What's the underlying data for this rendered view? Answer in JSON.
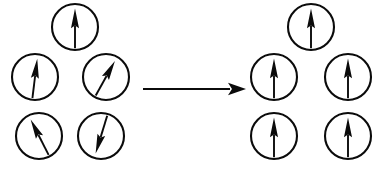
{
  "figure": {
    "width": 386,
    "height": 174,
    "background_color": "#ffffff",
    "ink_color": "#0b0b0b"
  },
  "reaction_arrow": {
    "name": "rightwards-arrow",
    "label": "",
    "x_start": 143,
    "x_end": 246,
    "y": 89,
    "direction": "right"
  },
  "left_group": {
    "name": "disordered-spin-cluster",
    "label": "",
    "circle_radius": 23,
    "spins": [
      {
        "id": "left-top",
        "cx": 75,
        "cy": 27,
        "angle_deg": 0,
        "description": "arrow pointing up"
      },
      {
        "id": "left-middle-left",
        "cx": 35,
        "cy": 77,
        "angle_deg": 7,
        "description": "arrow tilted slightly right of vertical"
      },
      {
        "id": "left-middle-right",
        "cx": 106,
        "cy": 77,
        "angle_deg": 29,
        "description": "arrow tilted up and to the right"
      },
      {
        "id": "left-bottom-left",
        "cx": 39,
        "cy": 136,
        "angle_deg": -27,
        "description": "arrow tilted up and to the left"
      },
      {
        "id": "left-bottom-right",
        "cx": 101,
        "cy": 136,
        "angle_deg": 197,
        "description": "arrow pointing down and slightly left"
      }
    ]
  },
  "right_group": {
    "name": "aligned-spin-cluster",
    "label": "",
    "circle_radius": 23,
    "spins": [
      {
        "id": "right-top",
        "cx": 311,
        "cy": 27,
        "angle_deg": 0,
        "description": "arrow pointing up"
      },
      {
        "id": "right-middle-left",
        "cx": 274,
        "cy": 77,
        "angle_deg": 0,
        "description": "arrow pointing up"
      },
      {
        "id": "right-middle-right",
        "cx": 348,
        "cy": 77,
        "angle_deg": 0,
        "description": "arrow pointing up"
      },
      {
        "id": "right-bottom-left",
        "cx": 274,
        "cy": 136,
        "angle_deg": 0,
        "description": "arrow pointing up"
      },
      {
        "id": "right-bottom-right",
        "cx": 348,
        "cy": 136,
        "angle_deg": 0,
        "description": "arrow pointing up"
      }
    ]
  }
}
